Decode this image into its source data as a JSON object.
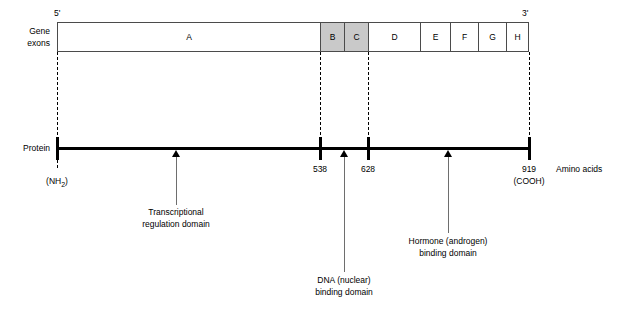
{
  "diagram": {
    "gene_row": {
      "label_line1": "Gene",
      "label_line2": "exons",
      "five_prime": "5'",
      "three_prime": "3'",
      "exons": [
        {
          "name": "A",
          "shaded": false
        },
        {
          "name": "B",
          "shaded": true
        },
        {
          "name": "C",
          "shaded": true
        },
        {
          "name": "D",
          "shaded": false
        },
        {
          "name": "E",
          "shaded": false
        },
        {
          "name": "F",
          "shaded": false
        },
        {
          "name": "G",
          "shaded": false
        },
        {
          "name": "H",
          "shaded": false
        }
      ]
    },
    "protein_row": {
      "label": "Protein",
      "n_terminus": "(NH",
      "n_terminus_sub": "2",
      "n_terminus_close": ")",
      "c_terminus": "(COOH)",
      "axis_caption": "Amino acids",
      "positions": [
        {
          "value": "538"
        },
        {
          "value": "628"
        },
        {
          "value": "919"
        }
      ]
    },
    "domains": [
      {
        "line1": "Transcriptional",
        "line2": "regulation domain"
      },
      {
        "line1": "DNA (nuclear)",
        "line2": "binding domain"
      },
      {
        "line1": "Hormone (androgen)",
        "line2": "binding domain"
      }
    ]
  },
  "colors": {
    "shaded_exon": "#c9c9c9",
    "box_stroke": "#4b4b4b",
    "protein_bar": "#000000",
    "callout_line": "#6e6e6e"
  }
}
